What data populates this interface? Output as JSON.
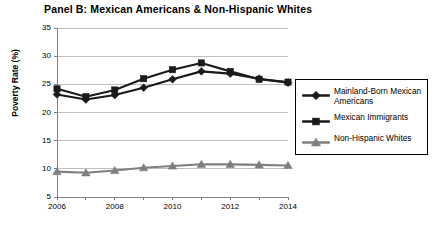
{
  "chart_data": {
    "type": "line",
    "title": "Panel B: Mexican Americans & Non-Hispanic Whites",
    "xlabel": "",
    "ylabel": "Poverty Rate (%)",
    "x": [
      2006,
      2007,
      2008,
      2009,
      2010,
      2011,
      2012,
      2013,
      2014
    ],
    "xtick_labels": [
      "2006",
      "2008",
      "2010",
      "2012",
      "2014"
    ],
    "xtick_values": [
      2006,
      2008,
      2010,
      2012,
      2014
    ],
    "ytick_labels": [
      "5",
      "10",
      "15",
      "20",
      "25",
      "30",
      "35"
    ],
    "ytick_values": [
      5,
      10,
      15,
      20,
      25,
      30,
      35
    ],
    "xlim": [
      2006,
      2014
    ],
    "ylim": [
      5,
      35
    ],
    "grid": "horizontal",
    "legend_position": "right",
    "series": [
      {
        "name": "Mainland-Born Mexican Americans",
        "marker": "diamond",
        "color": "#1a1a1a",
        "values": [
          23.2,
          22.3,
          23.1,
          24.4,
          25.9,
          27.3,
          26.9,
          26.0,
          25.3
        ]
      },
      {
        "name": "Mexican Immigrants",
        "marker": "square",
        "color": "#1a1a1a",
        "values": [
          24.2,
          22.8,
          24.0,
          26.0,
          27.6,
          28.8,
          27.3,
          25.9,
          25.4
        ]
      },
      {
        "name": "Non-Hispanic Whites",
        "marker": "triangle",
        "color": "#7f7f7f",
        "values": [
          9.5,
          9.3,
          9.7,
          10.2,
          10.5,
          10.8,
          10.8,
          10.7,
          10.6
        ]
      }
    ]
  },
  "legend": {
    "items": [
      {
        "label": "Mainland-Born Mexican Americans",
        "marker": "diamond",
        "color": "#1a1a1a"
      },
      {
        "label": "Mexican Immigrants",
        "marker": "square",
        "color": "#1a1a1a"
      },
      {
        "label": "Non-Hispanic Whites",
        "marker": "triangle",
        "color": "#7f7f7f"
      }
    ]
  },
  "colors": {
    "axis": "#808080",
    "grid": "#bfbfbf",
    "dark_series": "#1a1a1a",
    "gray_series": "#7f7f7f",
    "background": "#ffffff"
  }
}
